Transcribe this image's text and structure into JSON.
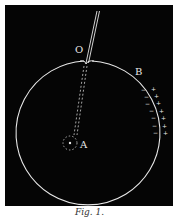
{
  "figure": {
    "caption": "Fig. 1.",
    "labels": {
      "point_o": "O",
      "point_b": "B",
      "point_a": "A"
    },
    "charges": {
      "outer_sign": "+",
      "inner_sign": "−",
      "count": 7
    },
    "colors": {
      "background": "#050505",
      "line": "#e8e8e8",
      "page": "#ffffff"
    },
    "elements": [
      "conducting sphere (circle)",
      "rod/wire entering at O",
      "dashed path to A",
      "small dotted circle around A",
      "surface charges near B"
    ]
  }
}
